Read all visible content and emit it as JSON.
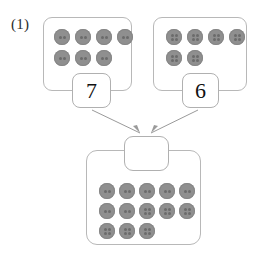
{
  "worksheet": {
    "problem_label": "(1)",
    "colors": {
      "button_fill": "#8f8f8f",
      "button_hole": "#6b6b6b",
      "box_border": "#b8b8b8",
      "arrow": "#9a9a9a",
      "text": "#111111",
      "background": "#ffffff"
    },
    "addends": [
      {
        "position": "left",
        "value": "7",
        "button_total": 7,
        "button_hole_type": "2-hole",
        "rows": [
          [
            "2-hole",
            "2-hole",
            "2-hole",
            "2-hole"
          ],
          [
            "2-hole",
            "2-hole",
            "2-hole"
          ]
        ]
      },
      {
        "position": "right",
        "value": "6",
        "button_total": 6,
        "button_hole_type": "4-hole",
        "rows": [
          [
            "4-hole",
            "4-hole",
            "4-hole",
            "4-hole"
          ],
          [
            "4-hole",
            "4-hole"
          ]
        ]
      }
    ],
    "sum": {
      "value": "",
      "answer_placeholder": "",
      "button_total": 13,
      "rows": [
        [
          "2-hole",
          "2-hole",
          "2-hole",
          "2-hole",
          "2-hole"
        ],
        [
          "2-hole",
          "2-hole",
          "4-hole",
          "4-hole",
          "4-hole"
        ],
        [
          "4-hole",
          "4-hole",
          "4-hole"
        ]
      ]
    },
    "arrows": [
      {
        "name": "arrow-left-to-sum",
        "from": "left-addend",
        "to": "answer-box"
      },
      {
        "name": "arrow-right-to-sum",
        "from": "right-addend",
        "to": "answer-box"
      }
    ]
  }
}
